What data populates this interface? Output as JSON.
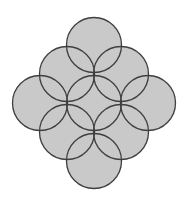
{
  "diagram": {
    "background": "#ffffff",
    "fill_color": "#c9c9c9",
    "stroke_color": "#3f3f3f",
    "stroke_width": 1.3,
    "radius": 27.5,
    "circles": [
      {
        "cx": 94,
        "cy": 45
      },
      {
        "cx": 67,
        "cy": 74
      },
      {
        "cx": 121,
        "cy": 74
      },
      {
        "cx": 40,
        "cy": 103
      },
      {
        "cx": 94,
        "cy": 103
      },
      {
        "cx": 148,
        "cy": 103
      },
      {
        "cx": 67,
        "cy": 132
      },
      {
        "cx": 121,
        "cy": 132
      },
      {
        "cx": 94,
        "cy": 161
      }
    ]
  }
}
